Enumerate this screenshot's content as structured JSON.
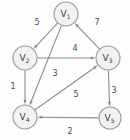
{
  "figure": {
    "background_color": "#fdfdfd",
    "node_fill_color": "#f2f2f2",
    "node_stroke_color": "#9a9a9a",
    "edge_color": "#8c8c8c",
    "label_color": "#3a3a3a"
  },
  "chart_data": {
    "type": "diagram",
    "diagram_kind": "weighted-directed-graph",
    "title": "",
    "directed": true,
    "weighted": true,
    "nodes": [
      {
        "id": "V1",
        "base": "V",
        "subscript": "1",
        "label": "V1",
        "x": 66,
        "y": 14,
        "r": 12
      },
      {
        "id": "V2",
        "base": "V",
        "subscript": "2",
        "label": "V2",
        "x": 25,
        "y": 58,
        "r": 12
      },
      {
        "id": "V3",
        "base": "V",
        "subscript": "3",
        "label": "V3",
        "x": 108,
        "y": 58,
        "r": 12
      },
      {
        "id": "V4",
        "base": "V",
        "subscript": "4",
        "label": "V4",
        "x": 25,
        "y": 117,
        "r": 12
      },
      {
        "id": "V5",
        "base": "V",
        "subscript": "5",
        "label": "V5",
        "x": 110,
        "y": 118,
        "r": 11
      }
    ],
    "edges": [
      {
        "from": "V1",
        "to": "V2",
        "weight": "5",
        "label_x": 37,
        "label_y": 22
      },
      {
        "from": "V3",
        "to": "V1",
        "weight": "7",
        "label_x": 97,
        "label_y": 22
      },
      {
        "from": "V2",
        "to": "V3",
        "weight": "4",
        "label_x": 75,
        "label_y": 48
      },
      {
        "from": "V1",
        "to": "V4",
        "weight": "3",
        "label_x": 55,
        "label_y": 73
      },
      {
        "from": "V2",
        "to": "V4",
        "weight": "1",
        "label_x": 13,
        "label_y": 86
      },
      {
        "from": "V4",
        "to": "V3",
        "weight": "5",
        "label_x": 76,
        "label_y": 94
      },
      {
        "from": "V3",
        "to": "V5",
        "weight": "3",
        "label_x": 114,
        "label_y": 90
      },
      {
        "from": "V5",
        "to": "V4",
        "weight": "2",
        "label_x": 70,
        "label_y": 131
      }
    ],
    "edge_list_text": [
      "V1 -> V2 : 5",
      "V3 -> V1 : 7",
      "V2 -> V3 : 4",
      "V1 -> V4 : 3",
      "V2 -> V4 : 1",
      "V4 -> V3 : 5",
      "V3 -> V5 : 3",
      "V5 -> V4 : 2"
    ]
  }
}
